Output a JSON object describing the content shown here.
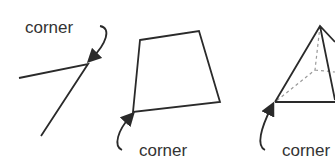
{
  "diagram": {
    "title": "",
    "figures": [
      {
        "id": "angle",
        "shape": "angle (two rays meeting)",
        "label": "corner",
        "label_position": "above-left"
      },
      {
        "id": "quadrilateral",
        "shape": "quadrilateral",
        "label": "corner",
        "label_position": "below"
      },
      {
        "id": "pyramid",
        "shape": "pyramid (3D, hidden edges dashed)",
        "label": "corner",
        "label_position": "below"
      }
    ],
    "colors": {
      "line": "#2a2a2a",
      "text": "#333333",
      "hidden_edges": "#9a9a9a",
      "background": "#ffffff"
    }
  }
}
